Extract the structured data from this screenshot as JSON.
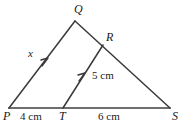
{
  "figure": {
    "type": "geometry-diagram",
    "stroke_color": "#3a3a3a",
    "baseline_color": "#6e6e6e",
    "background_color": "#ffffff",
    "width": 184,
    "height": 126
  },
  "vertices": [
    {
      "name": "Q",
      "label": "Q",
      "x": 75,
      "y": 21
    },
    {
      "name": "R",
      "label": "R",
      "x": 103,
      "y": 45
    },
    {
      "name": "P",
      "label": "P",
      "x": 9,
      "y": 108
    },
    {
      "name": "T",
      "label": "T",
      "x": 63,
      "y": 108
    },
    {
      "name": "S",
      "label": "S",
      "x": 170,
      "y": 108
    }
  ],
  "segments": [
    {
      "name": "PQ",
      "from": "P",
      "to": "Q",
      "x1": 9,
      "y1": 108,
      "x2": 75,
      "y2": 21
    },
    {
      "name": "QS",
      "from": "Q",
      "to": "S",
      "x1": 75,
      "y1": 21,
      "x2": 170,
      "y2": 108
    },
    {
      "name": "PS",
      "from": "P",
      "to": "S",
      "x1": 9,
      "y1": 108,
      "x2": 170,
      "y2": 108
    },
    {
      "name": "TR",
      "from": "T",
      "to": "R",
      "x1": 63,
      "y1": 108,
      "x2": 103,
      "y2": 45
    }
  ],
  "parallel_marks": [
    {
      "name": "parallel-mark-pq",
      "on_segment": "PQ",
      "x": 48,
      "y": 61
    },
    {
      "name": "parallel-mark-tr",
      "on_segment": "TR",
      "x": 85,
      "y": 76
    }
  ],
  "labels": {
    "vertex_Q": "Q",
    "vertex_R": "R",
    "vertex_P": "P",
    "vertex_T": "T",
    "vertex_S": "S",
    "side_x": "x",
    "length_PT": "4 cm",
    "length_TS": "6 cm",
    "length_TR": "5 cm"
  }
}
